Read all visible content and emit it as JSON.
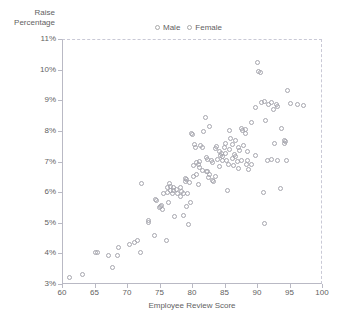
{
  "chart_data": {
    "type": "scatter",
    "title": "",
    "xlabel": "Employee Review Score",
    "ylabel": "Raise\nPercentage",
    "xlim": [
      60,
      100
    ],
    "ylim": [
      3,
      11
    ],
    "xticks": [
      60,
      65,
      70,
      75,
      80,
      85,
      90,
      95,
      100
    ],
    "xticklabels": [
      "60",
      "65",
      "70",
      "75",
      "80",
      "85",
      "90",
      "95",
      "100"
    ],
    "yticks": [
      3,
      4,
      5,
      6,
      7,
      8,
      9,
      10,
      11
    ],
    "yticklabels": [
      "3%",
      "4%",
      "5%",
      "6%",
      "7%",
      "8%",
      "9%",
      "10%",
      "11%"
    ],
    "grid": false,
    "legend_position": "top-center",
    "marker": "open-circle",
    "marker_color": "#a6a6ae",
    "series": [
      {
        "name": "Male",
        "color": "#a6a6ae",
        "points": [
          [
            61.0,
            3.25
          ],
          [
            63.0,
            3.35
          ],
          [
            65.0,
            4.05
          ],
          [
            65.3,
            4.07
          ],
          [
            67.0,
            3.95
          ],
          [
            67.6,
            3.57
          ],
          [
            68.4,
            3.96
          ],
          [
            68.6,
            4.22
          ],
          [
            70.2,
            4.32
          ],
          [
            71.0,
            4.4
          ],
          [
            71.4,
            4.46
          ],
          [
            71.9,
            4.05
          ],
          [
            72.0,
            6.3
          ],
          [
            73.1,
            5.05
          ],
          [
            73.2,
            5.12
          ],
          [
            74.0,
            4.63
          ],
          [
            74.2,
            5.8
          ],
          [
            74.4,
            5.77
          ],
          [
            75.0,
            5.55
          ],
          [
            75.1,
            5.6
          ],
          [
            75.3,
            5.45
          ],
          [
            75.9,
            4.45
          ],
          [
            76.0,
            6.02
          ],
          [
            76.5,
            6.22
          ],
          [
            76.6,
            6.1
          ],
          [
            76.8,
            5.98
          ],
          [
            77.0,
            6.18
          ],
          [
            77.2,
            5.25
          ],
          [
            77.6,
            6.0
          ],
          [
            78.0,
            5.9
          ],
          [
            78.3,
            6.05
          ],
          [
            78.5,
            5.27
          ],
          [
            78.9,
            6.38
          ],
          [
            79.0,
            5.55
          ],
          [
            79.2,
            6.0
          ],
          [
            79.3,
            4.98
          ],
          [
            79.6,
            5.7
          ],
          [
            79.8,
            7.95
          ],
          [
            79.9,
            7.9
          ],
          [
            80.0,
            6.55
          ],
          [
            80.2,
            7.6
          ],
          [
            80.4,
            7.5
          ],
          [
            80.6,
            7.0
          ],
          [
            80.8,
            6.95
          ],
          [
            81.0,
            6.85
          ],
          [
            81.2,
            7.55
          ],
          [
            81.4,
            7.48
          ],
          [
            81.6,
            8.02
          ],
          [
            81.9,
            8.47
          ],
          [
            82.0,
            6.7
          ],
          [
            82.2,
            7.1
          ],
          [
            82.4,
            6.5
          ],
          [
            82.6,
            8.18
          ],
          [
            82.8,
            7.05
          ],
          [
            83.0,
            6.42
          ],
          [
            83.2,
            6.38
          ],
          [
            83.4,
            7.45
          ],
          [
            83.6,
            7.52
          ],
          [
            83.8,
            7.1
          ],
          [
            84.0,
            6.88
          ],
          [
            84.2,
            7.22
          ],
          [
            84.4,
            7.3
          ],
          [
            84.6,
            7.18
          ],
          [
            84.8,
            7.48
          ],
          [
            85.0,
            7.62
          ],
          [
            85.2,
            7.05
          ],
          [
            85.4,
            6.95
          ],
          [
            85.6,
            8.05
          ],
          [
            85.8,
            7.8
          ],
          [
            86.0,
            7.12
          ],
          [
            86.2,
            6.9
          ],
          [
            86.4,
            7.25
          ],
          [
            86.6,
            7.72
          ],
          [
            86.8,
            7.02
          ],
          [
            87.0,
            6.8
          ],
          [
            87.2,
            7.4
          ],
          [
            87.4,
            8.12
          ],
          [
            87.6,
            8.05
          ],
          [
            87.8,
            7.55
          ],
          [
            88.0,
            7.95
          ],
          [
            88.2,
            6.95
          ],
          [
            88.4,
            7.35
          ],
          [
            88.6,
            6.78
          ],
          [
            89.0,
            8.3
          ],
          [
            89.6,
            8.78
          ],
          [
            89.9,
            10.28
          ],
          [
            90.0,
            9.97
          ],
          [
            90.4,
            9.95
          ],
          [
            90.6,
            8.95
          ],
          [
            91.0,
            9.0
          ],
          [
            91.2,
            8.38
          ],
          [
            91.6,
            8.9
          ],
          [
            92.0,
            8.95
          ],
          [
            92.4,
            8.72
          ],
          [
            92.8,
            8.88
          ],
          [
            93.0,
            8.82
          ],
          [
            93.6,
            8.12
          ],
          [
            94.0,
            7.72
          ],
          [
            94.2,
            7.68
          ],
          [
            94.6,
            9.35
          ],
          [
            95.0,
            8.92
          ],
          [
            96.0,
            8.88
          ],
          [
            97.0,
            8.85
          ]
        ]
      },
      {
        "name": "Female",
        "color": "#a6a6ae",
        "points": [
          [
            76.0,
            6.18
          ],
          [
            76.4,
            6.3
          ],
          [
            77.0,
            6.08
          ],
          [
            77.4,
            6.12
          ],
          [
            78.0,
            6.2
          ],
          [
            78.6,
            6.0
          ],
          [
            79.4,
            6.35
          ],
          [
            80.0,
            6.9
          ],
          [
            80.5,
            6.6
          ],
          [
            81.0,
            7.02
          ],
          [
            81.5,
            6.75
          ],
          [
            82.0,
            7.15
          ],
          [
            82.5,
            6.62
          ],
          [
            83.0,
            7.0
          ],
          [
            83.5,
            6.55
          ],
          [
            84.0,
            7.35
          ],
          [
            84.5,
            7.05
          ],
          [
            85.0,
            7.28
          ],
          [
            85.3,
            6.08
          ],
          [
            85.6,
            7.42
          ],
          [
            86.0,
            7.58
          ],
          [
            86.5,
            7.2
          ],
          [
            87.0,
            7.48
          ],
          [
            87.5,
            7.05
          ],
          [
            88.0,
            8.08
          ],
          [
            88.4,
            7.05
          ],
          [
            89.0,
            6.95
          ],
          [
            89.6,
            7.22
          ],
          [
            90.8,
            6.02
          ],
          [
            91.0,
            5.02
          ],
          [
            91.4,
            7.08
          ],
          [
            92.0,
            7.1
          ],
          [
            92.6,
            7.62
          ],
          [
            93.0,
            7.08
          ],
          [
            93.4,
            6.15
          ],
          [
            94.0,
            7.62
          ],
          [
            94.4,
            7.05
          ],
          [
            79.0,
            6.45
          ],
          [
            80.8,
            6.28
          ],
          [
            82.2,
            6.72
          ],
          [
            75.5,
            5.98
          ],
          [
            74.8,
            5.52
          ],
          [
            76.2,
            5.7
          ],
          [
            78.8,
            6.48
          ]
        ]
      }
    ]
  },
  "legend": {
    "items": [
      {
        "label": "Male"
      },
      {
        "label": "Female"
      }
    ]
  },
  "axes": {
    "y_title": "Raise\nPercentage",
    "x_title": "Employee Review Score"
  }
}
